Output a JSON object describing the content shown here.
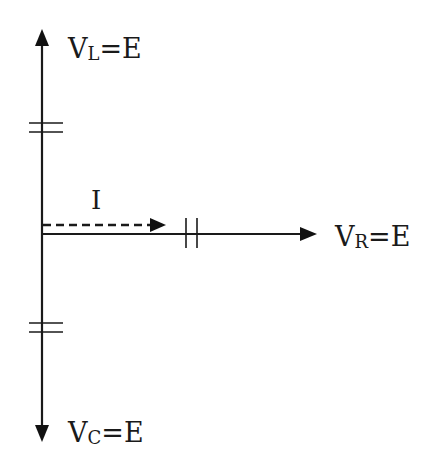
{
  "diagram": {
    "type": "phasor-diagram",
    "labels": {
      "inductor_voltage": {
        "symbol": "V",
        "subscript": "L",
        "equals": "=E"
      },
      "resistor_voltage": {
        "symbol": "V",
        "subscript": "R",
        "equals": "=E"
      },
      "capacitor_voltage": {
        "symbol": "V",
        "subscript": "C",
        "equals": "=E"
      },
      "current": "I"
    },
    "phasors": [
      {
        "name": "V_L",
        "direction": "up",
        "magnitude": "E"
      },
      {
        "name": "V_R",
        "direction": "right",
        "magnitude": "E"
      },
      {
        "name": "V_C",
        "direction": "down",
        "magnitude": "E"
      },
      {
        "name": "I",
        "direction": "right",
        "style": "dashed"
      }
    ],
    "equal_length_marks": {
      "V_L": "double-tick",
      "V_R": "double-tick",
      "V_C": "double-tick"
    },
    "colors": {
      "ink": "#1a1a1a",
      "background": "#ffffff"
    }
  }
}
